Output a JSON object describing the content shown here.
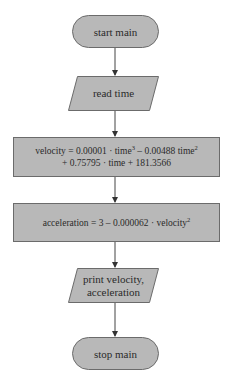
{
  "diagram": {
    "type": "flowchart",
    "fill_color": "#b8b8b8",
    "stroke_color": "#6b6b6b",
    "nodes": [
      {
        "id": "start",
        "shape": "terminal",
        "label": "start main"
      },
      {
        "id": "read",
        "shape": "input-output",
        "label": "read time"
      },
      {
        "id": "velocity",
        "shape": "process",
        "line1_prefix": "velocity = 0.00001 · time",
        "line1_exp1": "3",
        "line1_mid": " – 0.00488 time",
        "line1_exp2": "2",
        "line2": "+ 0.75795 · time + 181.3566"
      },
      {
        "id": "acceleration",
        "shape": "process",
        "prefix": "acceleration = 3 – 0.000062 · velocity",
        "exp": "2"
      },
      {
        "id": "print",
        "shape": "input-output",
        "line1": "print velocity,",
        "line2": "acceleration"
      },
      {
        "id": "stop",
        "shape": "terminal",
        "label": "stop main"
      }
    ],
    "edges": [
      {
        "from": "start",
        "to": "read"
      },
      {
        "from": "read",
        "to": "velocity"
      },
      {
        "from": "velocity",
        "to": "acceleration"
      },
      {
        "from": "acceleration",
        "to": "print"
      },
      {
        "from": "print",
        "to": "stop"
      }
    ]
  }
}
